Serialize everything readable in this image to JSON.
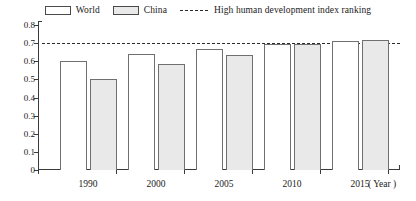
{
  "chart_data": {
    "type": "bar",
    "title": "",
    "subtitle": "",
    "xlabel": "( Year )",
    "ylabel": "",
    "categories": [
      "1990",
      "2000",
      "2005",
      "2010",
      "2015"
    ],
    "series": [
      {
        "name": "World",
        "values": [
          0.6,
          0.64,
          0.665,
          0.695,
          0.71
        ],
        "color": "#ffffff",
        "edge_color": "#707070"
      },
      {
        "name": "China",
        "values": [
          0.5,
          0.585,
          0.635,
          0.695,
          0.715
        ],
        "color": "#e9e9e9",
        "edge_color": "#707070"
      }
    ],
    "reference_line": {
      "label": "High human development index ranking",
      "value": 0.7,
      "style": "dashed",
      "color": "#2b2b2b"
    },
    "ylim": [
      0,
      0.8
    ],
    "yticks": [
      0,
      0.1,
      0.2,
      0.3,
      0.4,
      0.5,
      0.6,
      0.7,
      0.8
    ],
    "ytick_labels": [
      "0",
      "0.1",
      "0.2",
      "0.3",
      "0.4",
      "0.5",
      "0.6",
      "0.7",
      "0.8"
    ],
    "grid": false,
    "legend_position": "top-center",
    "legend": [
      {
        "label": "World",
        "swatch": "white-box"
      },
      {
        "label": "China",
        "swatch": "gray-box"
      },
      {
        "label": "High human development index ranking",
        "swatch": "dashed-line"
      }
    ]
  },
  "axis": {
    "x_title": "( Year )"
  }
}
